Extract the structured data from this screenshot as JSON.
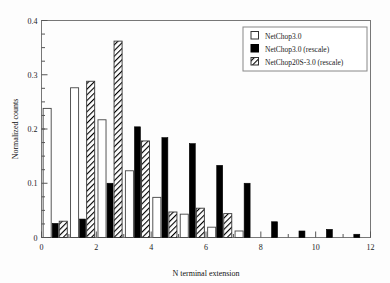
{
  "chart_data": {
    "type": "bar",
    "title": "",
    "xlabel": "N terminal extension",
    "ylabel": "Normalized counts",
    "xlim": [
      0,
      12
    ],
    "ylim": [
      0,
      0.4
    ],
    "xticks": [
      0,
      2,
      4,
      6,
      8,
      10,
      12
    ],
    "yticks": [
      0,
      0.1,
      0.2,
      0.3,
      0.4
    ],
    "xticklabels": [
      "0",
      "2",
      "4",
      "6",
      "8",
      "10",
      "12"
    ],
    "yticklabels": [
      "0",
      "0.1",
      "0.2",
      "0.3",
      "0.4"
    ],
    "grid": false,
    "legend_position": "upper right",
    "categories": [
      0,
      1,
      2,
      3,
      4,
      5,
      6,
      7,
      8,
      9,
      10,
      11
    ],
    "series": [
      {
        "name": "NetChop3.0",
        "fill": "open",
        "values": [
          0.238,
          0.276,
          0.217,
          0.123,
          0.074,
          0.043,
          0.019,
          0.012,
          0.0,
          0.0,
          0.0,
          0.0
        ]
      },
      {
        "name": "NetChop3.0 (rescale)",
        "fill": "solid",
        "values": [
          0.026,
          0.034,
          0.1,
          0.204,
          0.184,
          0.173,
          0.133,
          0.1,
          0.029,
          0.012,
          0.015,
          0.006
        ]
      },
      {
        "name": "NetChop20S-3.0 (rescale)",
        "fill": "hatch",
        "values": [
          0.03,
          0.288,
          0.362,
          0.178,
          0.047,
          0.054,
          0.044,
          0.0,
          0.0,
          0.0,
          0.0,
          0.0
        ]
      }
    ]
  },
  "legend": {
    "entries": [
      {
        "label": "NetChop3.0",
        "swatch": "open-square-icon"
      },
      {
        "label": "NetChop3.0 (rescale)",
        "swatch": "filled-square-icon"
      },
      {
        "label": "NetChop20S-3.0 (rescale)",
        "swatch": "hatched-square-icon"
      }
    ]
  }
}
